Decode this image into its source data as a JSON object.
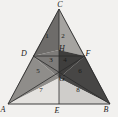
{
  "figure": {
    "background_color": "#f2f1ef",
    "stroke_color": "#2b2b2b",
    "vertices": [
      {
        "name": "A",
        "label": "A",
        "x": 8,
        "y": 104
      },
      {
        "name": "B",
        "label": "B",
        "x": 110,
        "y": 104
      },
      {
        "name": "C",
        "label": "C",
        "x": 59,
        "y": 9
      },
      {
        "name": "D",
        "label": "D",
        "x": 33,
        "y": 56
      },
      {
        "name": "E",
        "label": "E",
        "x": 59,
        "y": 104
      },
      {
        "name": "F",
        "label": "F",
        "x": 85,
        "y": 56
      },
      {
        "name": "G",
        "label": "G",
        "x": 59,
        "y": 78
      },
      {
        "name": "H",
        "label": "H",
        "x": 59,
        "y": 50
      }
    ],
    "vertex_labels": [
      {
        "name": "label-C",
        "text": "C",
        "x": 60,
        "y": 7
      },
      {
        "name": "label-D",
        "text": "D",
        "x": 24,
        "y": 56
      },
      {
        "name": "label-F",
        "text": "F",
        "x": 88,
        "y": 56
      },
      {
        "name": "label-H",
        "text": "H",
        "x": 62,
        "y": 51
      },
      {
        "name": "label-G",
        "text": "G",
        "x": 62,
        "y": 81
      },
      {
        "name": "label-A",
        "text": "A",
        "x": 3,
        "y": 112
      },
      {
        "name": "label-E",
        "text": "E",
        "x": 57,
        "y": 113
      },
      {
        "name": "label-B",
        "text": "B",
        "x": 106,
        "y": 112
      }
    ],
    "regions": [
      {
        "id": 1,
        "label": "1",
        "shade": "#6e6c6a",
        "cx": 47,
        "cy": 38
      },
      {
        "id": 2,
        "label": "2",
        "shade": "#a5a3a0",
        "cx": 63,
        "cy": 38
      },
      {
        "id": 3,
        "label": "3",
        "shade": "#7d7b79",
        "cx": 51,
        "cy": 62
      },
      {
        "id": 4,
        "label": "4",
        "shade": "#3f3e3d",
        "cx": 65,
        "cy": 62
      },
      {
        "id": 5,
        "label": "5",
        "shade": "#8f8d8a",
        "cx": 38,
        "cy": 73
      },
      {
        "id": 6,
        "label": "6",
        "shade": "#474645",
        "cx": 80,
        "cy": 73
      },
      {
        "id": 7,
        "label": "7",
        "shade": "#e4e2df",
        "cx": 41,
        "cy": 92
      },
      {
        "id": 8,
        "label": "8",
        "shade": "#cfcdca",
        "cx": 78,
        "cy": 92
      }
    ],
    "edges": [
      {
        "name": "side-AB",
        "from": "A",
        "to": "B"
      },
      {
        "name": "side-AC",
        "from": "A",
        "to": "C"
      },
      {
        "name": "side-BC",
        "from": "B",
        "to": "C"
      },
      {
        "name": "midline-DF",
        "from": "D",
        "to": "F"
      },
      {
        "name": "cevian-CE",
        "from": "C",
        "to": "E"
      },
      {
        "name": "cevian-AF",
        "from": "A",
        "to": "F"
      },
      {
        "name": "cevian-BD",
        "from": "B",
        "to": "D"
      }
    ]
  }
}
